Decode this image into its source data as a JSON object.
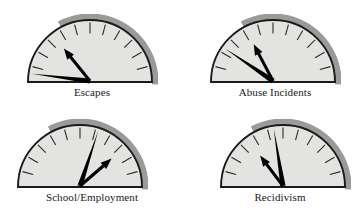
{
  "figure": {
    "type": "gauge-panel",
    "background_color": "#ffffff",
    "rows": 2,
    "columns": 2
  },
  "chart_data": {
    "type": "gauge",
    "title": "",
    "subtitle": "",
    "xlabel": "",
    "ylabel": "",
    "grid": false,
    "legend": "none",
    "gauge_geometry": {
      "shape": "semicircle",
      "sweep_start_deg": 180,
      "sweep_end_deg": 0,
      "tick_count": 11,
      "tick_interval_deg": 15,
      "tick_angles_deg": [
        180,
        165,
        150,
        135,
        120,
        105,
        90,
        75,
        60,
        45,
        30,
        15,
        0
      ],
      "face_color": "#e3e3e1",
      "rim_color": "#9a9a98",
      "outline_color": "#1a1a1a",
      "needle_color": "#000000"
    },
    "gauges": [
      {
        "id": "escapes",
        "label": "Escapes",
        "needles": [
          {
            "name": "baseline-needle",
            "style": "line",
            "angle_deg": 172,
            "length_frac": 1.0
          },
          {
            "name": "current-needle",
            "style": "arrow",
            "angle_deg": 128,
            "length_frac": 0.72
          }
        ]
      },
      {
        "id": "abuse-incidents",
        "label": "Abuse Incidents",
        "needles": [
          {
            "name": "baseline-needle",
            "style": "line",
            "angle_deg": 145,
            "length_frac": 1.0
          },
          {
            "name": "current-needle",
            "style": "arrow",
            "angle_deg": 117,
            "length_frac": 0.72
          }
        ]
      },
      {
        "id": "school-employment",
        "label": "School/Employment",
        "needles": [
          {
            "name": "baseline-needle",
            "style": "line",
            "angle_deg": 72,
            "length_frac": 1.0
          },
          {
            "name": "current-needle",
            "style": "arrow",
            "angle_deg": 42,
            "length_frac": 0.72
          }
        ]
      },
      {
        "id": "recidivism",
        "label": "Recidivism",
        "needles": [
          {
            "name": "baseline-needle",
            "style": "line",
            "angle_deg": 99,
            "length_frac": 1.0
          },
          {
            "name": "current-needle",
            "style": "arrow",
            "angle_deg": 126,
            "length_frac": 0.66
          }
        ]
      }
    ]
  },
  "layout": {
    "cells": [
      {
        "left": 22,
        "top": 14,
        "width": 140,
        "label_top": 86
      },
      {
        "left": 205,
        "top": 14,
        "width": 140,
        "label_top": 86
      },
      {
        "left": 12,
        "top": 119,
        "width": 160,
        "label_top": 191
      },
      {
        "left": 215,
        "top": 119,
        "width": 130,
        "label_top": 191
      }
    ]
  }
}
